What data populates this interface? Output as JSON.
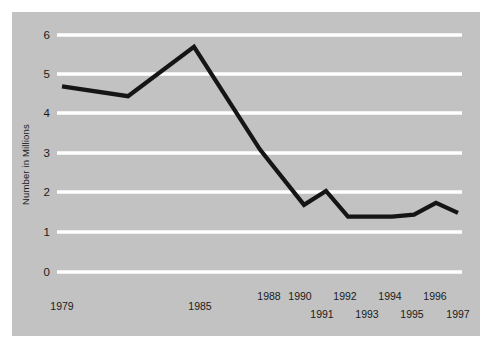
{
  "chart_data": {
    "type": "line",
    "title": "",
    "subtitle": "",
    "xlabel": "",
    "ylabel": "Number in Millions",
    "ylim": [
      0,
      6
    ],
    "xlim": [
      1979,
      1997
    ],
    "grid": "horizontal",
    "legend": "none",
    "background_color": "#c2c2c2",
    "gridline_color": "#ffffff",
    "line_color": "#151515",
    "y_ticks": [
      "0",
      "1",
      "2",
      "3",
      "4",
      "5",
      "6"
    ],
    "y_tick_values": [
      0,
      1,
      2,
      3,
      4,
      5,
      6
    ],
    "x_tick_labels_top": [
      "1979",
      "1985",
      "1988",
      "1990",
      "1992",
      "1994",
      "1996"
    ],
    "x_tick_labels_bottom": [
      "1991",
      "1993",
      "1995",
      "1997"
    ],
    "x": [
      1979,
      1982,
      1985,
      1988,
      1990,
      1991,
      1992,
      1993,
      1994,
      1995,
      1996,
      1997
    ],
    "values": [
      4.7,
      4.45,
      5.7,
      3.1,
      1.7,
      2.05,
      1.4,
      1.4,
      1.4,
      1.45,
      1.75,
      1.5
    ],
    "points": [
      {
        "x": 1979,
        "y": 4.7
      },
      {
        "x": 1982,
        "y": 4.45
      },
      {
        "x": 1985,
        "y": 5.7
      },
      {
        "x": 1988,
        "y": 3.1
      },
      {
        "x": 1990,
        "y": 1.7
      },
      {
        "x": 1991,
        "y": 2.05
      },
      {
        "x": 1992,
        "y": 1.4
      },
      {
        "x": 1993,
        "y": 1.4
      },
      {
        "x": 1994,
        "y": 1.4
      },
      {
        "x": 1995,
        "y": 1.45
      },
      {
        "x": 1996,
        "y": 1.75
      },
      {
        "x": 1997,
        "y": 1.5
      }
    ],
    "annotations": []
  },
  "axis": {
    "y_label": "Number in Millions",
    "y_tick_0": "0",
    "y_tick_1": "1",
    "y_tick_2": "2",
    "y_tick_3": "3",
    "y_tick_4": "4",
    "y_tick_5": "5",
    "y_tick_6": "6",
    "x_1979": "1979",
    "x_1985": "1985",
    "x_1988": "1988",
    "x_1990": "1990",
    "x_1991": "1991",
    "x_1992": "1992",
    "x_1993": "1993",
    "x_1994": "1994",
    "x_1995": "1995",
    "x_1996": "1996",
    "x_1997": "1997"
  }
}
